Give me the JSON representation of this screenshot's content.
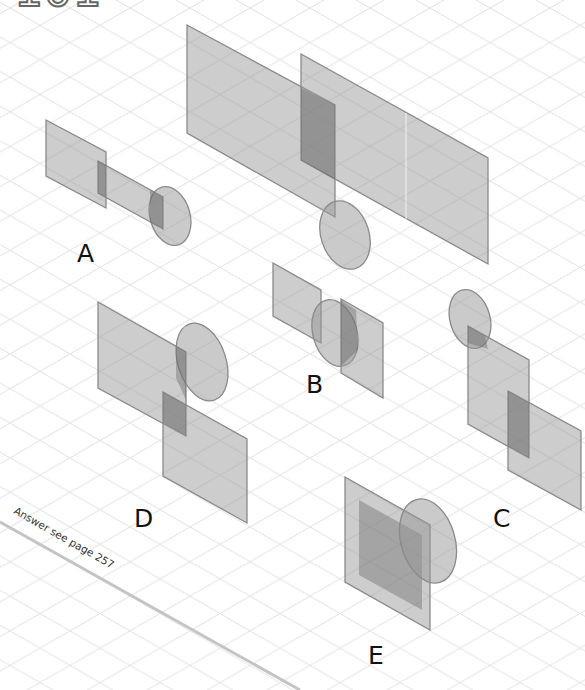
{
  "page": {
    "puzzle_number": "101",
    "answer_note": "Answer see page 257"
  },
  "options": [
    {
      "id": "A",
      "label": "A"
    },
    {
      "id": "B",
      "label": "B"
    },
    {
      "id": "C",
      "label": "C"
    },
    {
      "id": "D",
      "label": "D"
    },
    {
      "id": "E",
      "label": "E"
    }
  ],
  "colors": {
    "grid": "#e4e4e4",
    "plane_fill": "#a0a0a0",
    "plane_stroke": "#8a8a8a",
    "overlap_fill": "#6e6e6e",
    "label": "#111111",
    "divider": "#c8c8c8"
  }
}
